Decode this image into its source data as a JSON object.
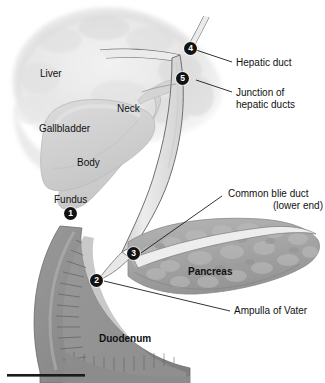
{
  "figure": {
    "type": "anatomical-illustration",
    "background_color": "#ffffff"
  },
  "structures": {
    "liver": "Liver",
    "gallbladder": "Gallbladder",
    "neck": "Neck",
    "body": "Body",
    "fundus": "Fundus",
    "pancreas": "Pancreas",
    "duodenum": "Duodenum"
  },
  "callouts": {
    "hepatic_duct": "Hepatic duct",
    "junction_line1": "Junction of",
    "junction_line2": "hepatic ducts",
    "common_bile_duct_line1": "Common blie duct",
    "common_bile_duct_line2": "(lower end)",
    "ampulla": "Ampulla of Vater"
  },
  "markers": [
    {
      "id": "1",
      "label": "1"
    },
    {
      "id": "2",
      "label": "2"
    },
    {
      "id": "3",
      "label": "3"
    },
    {
      "id": "4",
      "label": "4"
    },
    {
      "id": "5",
      "label": "5"
    }
  ],
  "colors": {
    "ink": "#111111",
    "marker_fill": "#121212",
    "marker_text": "#ffffff",
    "liver_fill": "#e9e9e9",
    "gallbladder_fill": "#d2d2d2",
    "pancreas_fill": "#a6a6a6",
    "duodenum_wall": "#8f8f8f",
    "duct_fill": "#e4e4e4",
    "scalebar": "#1a1a1a"
  }
}
